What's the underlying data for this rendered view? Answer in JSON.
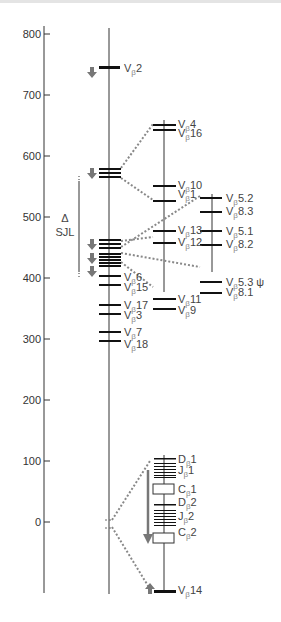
{
  "figure": {
    "axis": {
      "ticks": [
        "800",
        "700",
        "600",
        "500",
        "400",
        "300",
        "200",
        "100",
        "0"
      ]
    },
    "deletion_marker": {
      "delta": "Δ",
      "label": "SJL"
    },
    "main_genes": [
      {
        "base": "V",
        "sub": "β",
        "num": "2"
      },
      {
        "base": "V",
        "sub": "β",
        "num": "6"
      },
      {
        "base": "V",
        "sub": "β",
        "num": "15"
      },
      {
        "base": "V",
        "sub": "β",
        "num": "17"
      },
      {
        "base": "V",
        "sub": "β",
        "num": "3"
      },
      {
        "base": "V",
        "sub": "β",
        "num": "7"
      },
      {
        "base": "V",
        "sub": "β",
        "num": "18"
      }
    ],
    "expansion1_genes": [
      {
        "base": "V",
        "sub": "β",
        "num": "4"
      },
      {
        "base": "V",
        "sub": "β",
        "num": "16"
      },
      {
        "base": "V",
        "sub": "β",
        "num": "10"
      },
      {
        "base": "V",
        "sub": "β",
        "num": "1"
      },
      {
        "base": "V",
        "sub": "β",
        "num": "13"
      },
      {
        "base": "V",
        "sub": "β",
        "num": "12"
      },
      {
        "base": "V",
        "sub": "β",
        "num": "11"
      },
      {
        "base": "V",
        "sub": "β",
        "num": "9"
      }
    ],
    "expansion2_genes": [
      {
        "base": "V",
        "sub": "β",
        "num": "5.2"
      },
      {
        "base": "V",
        "sub": "β",
        "num": "8.3"
      },
      {
        "base": "V",
        "sub": "β",
        "num": "5.1"
      },
      {
        "base": "V",
        "sub": "β",
        "num": "8.2"
      },
      {
        "base": "V",
        "sub": "β",
        "num": "5.3 ψ"
      },
      {
        "base": "V",
        "sub": "β",
        "num": "8.1"
      }
    ],
    "constant_region_genes": [
      {
        "base": "D",
        "sub": "β",
        "num": "1"
      },
      {
        "base": "J",
        "sub": "β",
        "num": "1"
      },
      {
        "base": "C",
        "sub": "β",
        "num": "1"
      },
      {
        "base": "D",
        "sub": "β",
        "num": "2"
      },
      {
        "base": "J",
        "sub": "β",
        "num": "2"
      },
      {
        "base": "C",
        "sub": "β",
        "num": "2"
      },
      {
        "base": "V",
        "sub": "β",
        "num": "14"
      }
    ]
  }
}
